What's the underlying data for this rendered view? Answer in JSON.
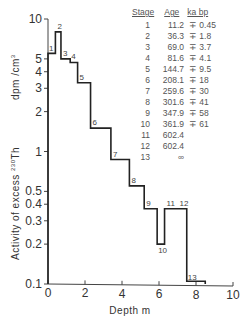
{
  "chart_data": {
    "type": "line",
    "subtype": "step",
    "title": "",
    "xlabel": "Depth  m",
    "ylabel": "Activity of excess 230Th  dpm/cm3",
    "xlim": [
      0,
      10
    ],
    "ylim": [
      0.1,
      10
    ],
    "yscale": "log",
    "x_ticks": [
      "0",
      "2",
      "4",
      "6",
      "8",
      "10"
    ],
    "y_ticks": [
      "10",
      "5",
      "4",
      "3",
      "2",
      "1",
      "0.5",
      "0.4",
      "0.3",
      "0.2",
      "0.1"
    ],
    "steps": [
      {
        "stage": "1",
        "x_start": 0.0,
        "x_end": 0.4,
        "value": 5.5
      },
      {
        "stage": "2",
        "x_start": 0.4,
        "x_end": 0.7,
        "value": 8.0
      },
      {
        "stage": "3",
        "x_start": 0.7,
        "x_end": 1.2,
        "value": 5.0
      },
      {
        "stage": "4",
        "x_start": 1.2,
        "x_end": 1.6,
        "value": 4.7
      },
      {
        "stage": "5",
        "x_start": 1.6,
        "x_end": 2.3,
        "value": 3.3
      },
      {
        "stage": "6",
        "x_start": 2.3,
        "x_end": 3.4,
        "value": 1.5
      },
      {
        "stage": "7",
        "x_start": 3.4,
        "x_end": 4.4,
        "value": 0.87
      },
      {
        "stage": "8",
        "x_start": 4.4,
        "x_end": 5.2,
        "value": 0.55
      },
      {
        "stage": "9",
        "x_start": 5.2,
        "x_end": 5.9,
        "value": 0.37
      },
      {
        "stage": "10",
        "x_start": 5.9,
        "x_end": 6.3,
        "value": 0.2
      },
      {
        "stage": "11",
        "x_start": 6.3,
        "x_end": 7.0,
        "value": 0.37
      },
      {
        "stage": "12",
        "x_start": 7.0,
        "x_end": 7.5,
        "value": 0.37
      },
      {
        "stage": "13",
        "x_start": 7.5,
        "x_end": 8.5,
        "value": 0.105
      }
    ],
    "legend_table": {
      "headers": [
        "Stage",
        "Age",
        "ka bp"
      ],
      "rows": [
        {
          "stage": "1",
          "age": "11.2",
          "err": "∓ 0.45"
        },
        {
          "stage": "2",
          "age": "36.3",
          "err": "∓ 1.8"
        },
        {
          "stage": "3",
          "age": "69.0",
          "err": "∓ 3.7"
        },
        {
          "stage": "4",
          "age": "81.6",
          "err": "∓ 4.1"
        },
        {
          "stage": "5",
          "age": "144.7",
          "err": "∓ 9.5"
        },
        {
          "stage": "6",
          "age": "208.1",
          "err": "∓ 18"
        },
        {
          "stage": "7",
          "age": "259.6",
          "err": "∓ 30"
        },
        {
          "stage": "8",
          "age": "301.6",
          "err": "∓ 41"
        },
        {
          "stage": "9",
          "age": "347.9",
          "err": "∓ 58"
        },
        {
          "stage": "10",
          "age": "361.9",
          "err": "∓ 61"
        },
        {
          "stage": "11",
          "age": "602.4",
          "err": ""
        },
        {
          "stage": "12",
          "age": "602.4",
          "err": ""
        },
        {
          "stage": "13",
          "age": "∞",
          "err": ""
        }
      ]
    }
  },
  "axis": {
    "x_title": "Depth  m",
    "y_title_main": "Activity of excess ",
    "y_title_sup": "230",
    "y_title_th": "Th",
    "y_unit": "dpm /cm",
    "y_unit_sup": "3"
  },
  "table_header": {
    "stage": "Stage",
    "age": "Age",
    "unit": "ka bp"
  }
}
